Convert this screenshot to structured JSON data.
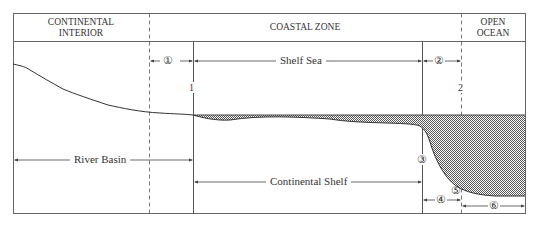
{
  "header": {
    "zones": [
      {
        "line1": "CONTINENTAL",
        "line2": "INTERIOR"
      },
      {
        "line1": "COASTAL ZONE",
        "line2": ""
      },
      {
        "line1": "OPEN",
        "line2": "OCEAN"
      }
    ]
  },
  "spans": {
    "zone1": "①",
    "shelf_sea": "Shelf Sea",
    "zone2": "②",
    "river_basin": "River Basin",
    "continental_shelf": "Continental Shelf",
    "zone3": "③",
    "zone4": "④",
    "zone5": "⑤",
    "zone6": "⑥"
  },
  "markers": {
    "line1": "1",
    "line2": "2"
  },
  "colors": {
    "line": "#333333",
    "frame": "#666666",
    "water_fill": "#9a9a9a"
  }
}
